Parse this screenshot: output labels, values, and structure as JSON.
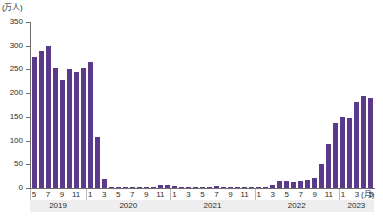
{
  "chart_data": {
    "type": "bar",
    "title": "",
    "subtitle": "",
    "xlabel": "(月)",
    "ylabel": "(万人)",
    "y_unit_label": "(万人)",
    "x_month_unit_label": "(月)",
    "x_year_unit_label": "(年)",
    "ylim": [
      0,
      350
    ],
    "ytick_values": [
      0,
      50,
      100,
      150,
      200,
      250,
      300,
      350
    ],
    "ytick_labels": [
      "0",
      "50",
      "100",
      "150",
      "200",
      "250",
      "300",
      "350"
    ],
    "grid": false,
    "legend": "none",
    "bar_color": "#5b3a8c",
    "axis_color": "#6f6f6f",
    "year_band_color": "#eeeeee",
    "x": [
      "2019-05",
      "2019-06",
      "2019-07",
      "2019-08",
      "2019-09",
      "2019-10",
      "2019-11",
      "2019-12",
      "2020-01",
      "2020-02",
      "2020-03",
      "2020-04",
      "2020-05",
      "2020-06",
      "2020-07",
      "2020-08",
      "2020-09",
      "2020-10",
      "2020-11",
      "2020-12",
      "2021-01",
      "2021-02",
      "2021-03",
      "2021-04",
      "2021-05",
      "2021-06",
      "2021-07",
      "2021-08",
      "2021-09",
      "2021-10",
      "2021-11",
      "2021-12",
      "2022-01",
      "2022-02",
      "2022-03",
      "2022-04",
      "2022-05",
      "2022-06",
      "2022-07",
      "2022-08",
      "2022-09",
      "2022-10",
      "2022-11",
      "2022-12",
      "2023-01",
      "2023-02",
      "2023-03",
      "2023-04",
      "2023-05"
    ],
    "month_tick_labels": [
      "5",
      "",
      "7",
      "",
      "9",
      "",
      "11",
      "",
      "1",
      "",
      "3",
      "",
      "5",
      "",
      "7",
      "",
      "9",
      "",
      "11",
      "",
      "1",
      "",
      "3",
      "",
      "5",
      "",
      "7",
      "",
      "9",
      "",
      "11",
      "",
      "1",
      "",
      "3",
      "",
      "5",
      "",
      "7",
      "",
      "9",
      "",
      "11",
      "",
      "1",
      "",
      "3",
      "",
      "5",
      ""
    ],
    "values": [
      277,
      288,
      300,
      252,
      228,
      250,
      245,
      253,
      266,
      108,
      19,
      0.3,
      0.2,
      0.3,
      0.4,
      0.9,
      1.4,
      2.7,
      5.7,
      5.9,
      4.6,
      0.8,
      1.2,
      1.1,
      1.0,
      0.9,
      5.1,
      2.6,
      1.7,
      2.2,
      2.1,
      1.2,
      1.8,
      1.7,
      6.6,
      13.9,
      14.7,
      12.1,
      14.4,
      17.0,
      20.6,
      50.0,
      93.5,
      137.0,
      150.0,
      147.5,
      182.0,
      195.0,
      190.0
    ],
    "years": [
      {
        "label": "2019",
        "start_index": 0,
        "count": 8
      },
      {
        "label": "2020",
        "start_index": 8,
        "count": 12
      },
      {
        "label": "2021",
        "start_index": 20,
        "count": 12
      },
      {
        "label": "2022",
        "start_index": 32,
        "count": 12
      },
      {
        "label": "2023",
        "start_index": 44,
        "count": 5
      }
    ]
  }
}
